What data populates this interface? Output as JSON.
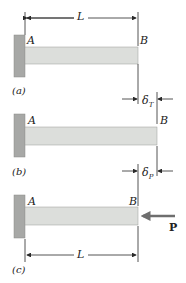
{
  "colors": {
    "wall": "#a7a8a6",
    "bar": "#dcdedb",
    "bar_edge": "#9a9c99",
    "line": "#2a2a2a",
    "force_arrow": "#6e6e6e"
  },
  "panel_a": {
    "label": "(a)",
    "point_a": "A",
    "point_b": "B",
    "dimension": "L"
  },
  "panel_b": {
    "label": "(b)",
    "point_a": "A",
    "point_b": "B",
    "delta_t": {
      "symbol": "δ",
      "subscript": "T"
    },
    "delta_p": {
      "symbol": "δ",
      "subscript": "P"
    }
  },
  "panel_c": {
    "label": "(c)",
    "point_a": "A",
    "point_b": "B",
    "force": "P",
    "dimension": "L"
  }
}
